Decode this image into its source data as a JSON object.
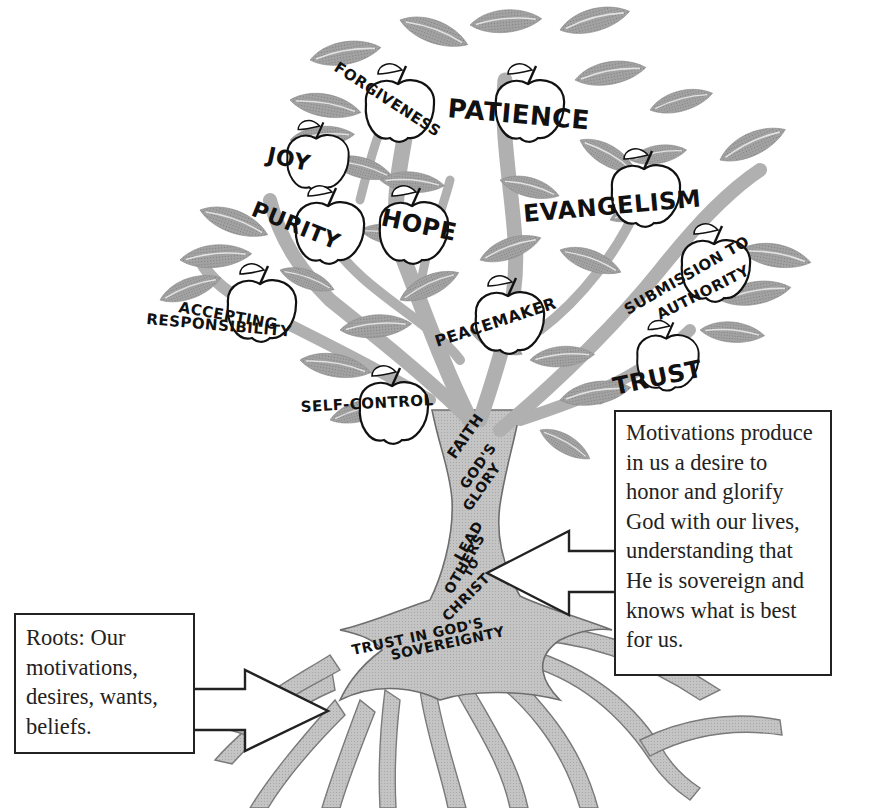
{
  "diagram": {
    "title": "",
    "colors": {
      "leaf": "#9a9a9a",
      "leaf_vein": "#d8d8d8",
      "branch": "#b5b5b5",
      "trunk": "#c2c2c2",
      "outline": "#6e6e6e",
      "fruit": "#ffffff",
      "text": "#111111",
      "box_border": "#222222"
    },
    "fruits": [
      {
        "label": "FORGIVENESS"
      },
      {
        "label": "PATIENCE"
      },
      {
        "label": "JOY"
      },
      {
        "label": "EVANGELISM"
      },
      {
        "label": "PURITY"
      },
      {
        "label": "HOPE"
      },
      {
        "label": "SUBMISSION TO"
      },
      {
        "label": "AUTHORITY"
      },
      {
        "label": "ACCEPTING"
      },
      {
        "label": "RESPONSIBILITY"
      },
      {
        "label": "PEACEMAKER"
      },
      {
        "label": "TRUST"
      },
      {
        "label": "SELF-CONTROL"
      }
    ],
    "trunk_labels": [
      {
        "label": "FAITH"
      },
      {
        "label": "GOD'S"
      },
      {
        "label": "GLORY"
      },
      {
        "label": "LEAD"
      },
      {
        "label": "OTHERS"
      },
      {
        "label": "TO"
      },
      {
        "label": "CHRIST"
      },
      {
        "label": "TRUST IN GOD'S"
      },
      {
        "label": "SOVEREIGNTY"
      }
    ],
    "notes": {
      "right": {
        "lines": [
          "Motivations produce",
          "in us a desire to",
          "honor and glorify",
          "God with our lives,",
          "understanding that",
          "He is sovereign and",
          "knows what is best",
          "for us."
        ],
        "arrow_direction": "left"
      },
      "left": {
        "lines": [
          "Roots: Our",
          "motivations,",
          "desires, wants,",
          "beliefs."
        ],
        "arrow_direction": "right"
      }
    }
  }
}
